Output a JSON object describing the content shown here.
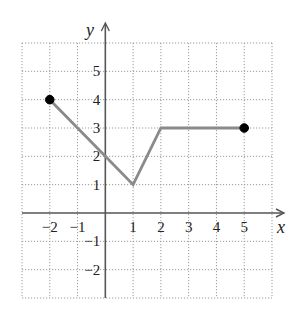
{
  "chart_data": {
    "type": "line",
    "title": "",
    "xlabel": "x",
    "ylabel": "y",
    "xlim": [
      -3,
      6
    ],
    "ylim": [
      -3,
      6
    ],
    "grid": true,
    "x_ticks": [
      -2,
      -1,
      1,
      2,
      3,
      4,
      5
    ],
    "y_ticks": [
      -2,
      -1,
      1,
      2,
      3,
      4,
      5
    ],
    "x_tick_labels": [
      "−2",
      "−1",
      "1",
      "2",
      "3",
      "4",
      "5"
    ],
    "y_tick_labels": [
      "−2",
      "−1",
      "1",
      "2",
      "3",
      "4",
      "5"
    ],
    "series": [
      {
        "name": "piecewise-linear graph",
        "color": "#8a8a8a",
        "points": [
          [
            -2,
            4
          ],
          [
            0,
            2
          ],
          [
            1,
            1
          ],
          [
            2,
            3
          ],
          [
            5,
            3
          ]
        ]
      }
    ],
    "endpoints": [
      {
        "x": -2,
        "y": 4,
        "style": "closed"
      },
      {
        "x": 5,
        "y": 3,
        "style": "closed"
      }
    ],
    "legend": null
  },
  "colors": {
    "axis": "#555555",
    "grid": "#9a9a9a",
    "line": "#8a8a8a",
    "endpoint": "#000000"
  }
}
